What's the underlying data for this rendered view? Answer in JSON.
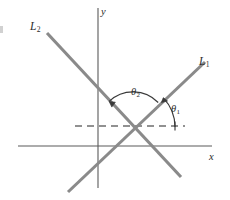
{
  "figure": {
    "kind": "geometry-diagram",
    "background_color": "#ffffff",
    "line_color": "#8a8a8a",
    "axis_color": "#5a5a5a",
    "arc_color": "#3a3a3a",
    "text_color": "#2b2b2b"
  },
  "labels": {
    "line1": "L",
    "line1_sub": "1",
    "line2": "L",
    "line2_sub": "2",
    "axis_x": "x",
    "axis_y": "y",
    "theta1": "θ",
    "theta1_sub": "1",
    "theta2": "θ",
    "theta2_sub": "2"
  },
  "geometry": {
    "intersection": {
      "x": 133,
      "y": 127
    },
    "x_axis": {
      "x1": 18,
      "y1": 146,
      "x2": 212,
      "y2": 146
    },
    "y_axis": {
      "x1": 98,
      "y1": 8,
      "x2": 98,
      "y2": 188
    },
    "dashed_ray": {
      "x1": 75,
      "y1": 126,
      "x2": 185,
      "y2": 126,
      "dash": "7 5"
    },
    "line_L1": {
      "x1": 68,
      "y1": 192,
      "x2": 205,
      "y2": 62
    },
    "line_L2": {
      "x1": 47,
      "y1": 33,
      "x2": 181,
      "y2": 177
    },
    "arc_theta1": {
      "center_x": 133,
      "center_y": 127,
      "radius": 42,
      "start_deg": 0,
      "end_deg": 44
    },
    "arc_theta2": {
      "center_x": 133,
      "center_y": 127,
      "radius": 35,
      "start_deg": 44,
      "end_deg": 133
    }
  }
}
